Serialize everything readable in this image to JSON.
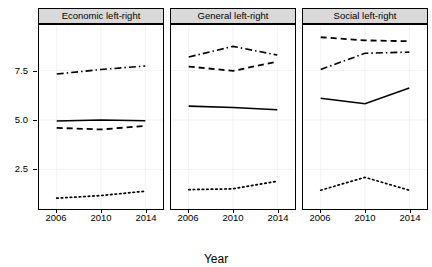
{
  "chart_data": {
    "type": "line",
    "title": "",
    "xlabel": "Year",
    "ylabel": "",
    "x": [
      2006,
      2010,
      2014
    ],
    "xtick_labels": [
      "2006",
      "2010",
      "2014"
    ],
    "ytick_labels": [
      "2.5",
      "5.0",
      "7.5"
    ],
    "ytick_values": [
      2.5,
      5.0,
      7.5
    ],
    "ylim": [
      0.45,
      9.85
    ],
    "xlim": [
      2004.4,
      2015.6
    ],
    "grid": true,
    "legend": "none",
    "facets": [
      {
        "label": "Economic left-right",
        "series": [
          {
            "name": "dash-dot",
            "style": "dashdot",
            "values": [
              7.32,
              7.55,
              7.73
            ]
          },
          {
            "name": "solid",
            "style": "solid",
            "values": [
              4.95,
              5.0,
              4.96
            ]
          },
          {
            "name": "dashed",
            "style": "dashed",
            "values": [
              4.6,
              4.52,
              4.7
            ]
          },
          {
            "name": "dotted",
            "style": "dotted",
            "values": [
              1.05,
              1.18,
              1.4
            ]
          }
        ]
      },
      {
        "label": "General left-right",
        "series": [
          {
            "name": "dash-dot",
            "style": "dashdot",
            "values": [
              8.18,
              8.72,
              8.28
            ]
          },
          {
            "name": "dashed",
            "style": "dashed",
            "values": [
              7.7,
              7.48,
              7.95
            ]
          },
          {
            "name": "solid",
            "style": "solid",
            "values": [
              5.7,
              5.63,
              5.52
            ]
          },
          {
            "name": "dotted",
            "style": "dotted",
            "values": [
              1.48,
              1.52,
              1.9
            ]
          }
        ]
      },
      {
        "label": "Social left-right",
        "series": [
          {
            "name": "dashed",
            "style": "dashed",
            "values": [
              9.18,
              9.02,
              8.98
            ]
          },
          {
            "name": "dash-dot",
            "style": "dashdot",
            "values": [
              7.55,
              8.37,
              8.43
            ]
          },
          {
            "name": "solid",
            "style": "solid",
            "values": [
              6.1,
              5.82,
              6.62
            ]
          },
          {
            "name": "dotted",
            "style": "dotted",
            "values": [
              1.45,
              2.1,
              1.45
            ]
          }
        ]
      }
    ]
  }
}
